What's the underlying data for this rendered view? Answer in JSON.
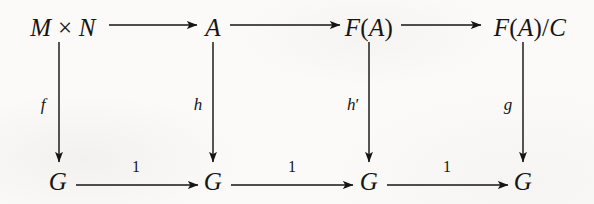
{
  "diagram": {
    "type": "commutative-diagram",
    "title": "",
    "rows": 2,
    "columns": 4,
    "nodes": [
      {
        "id": "n00",
        "label": "M × N",
        "row": 0,
        "col": 0,
        "x": 63,
        "y": 27
      },
      {
        "id": "n01",
        "label": "A",
        "row": 0,
        "col": 1,
        "x": 213,
        "y": 27
      },
      {
        "id": "n02",
        "label": "F(A)",
        "row": 0,
        "col": 2,
        "x": 369,
        "y": 27
      },
      {
        "id": "n03",
        "label": "F(A)/C",
        "row": 0,
        "col": 3,
        "x": 530,
        "y": 27
      },
      {
        "id": "n10",
        "label": "G",
        "row": 1,
        "col": 0,
        "x": 58,
        "y": 181
      },
      {
        "id": "n11",
        "label": "G",
        "row": 1,
        "col": 1,
        "x": 213,
        "y": 181
      },
      {
        "id": "n12",
        "label": "G",
        "row": 1,
        "col": 2,
        "x": 369,
        "y": 181
      },
      {
        "id": "n13",
        "label": "G",
        "row": 1,
        "col": 3,
        "x": 523,
        "y": 181
      }
    ],
    "arrows": [
      {
        "id": "a-top-1",
        "from": "n00",
        "to": "n01",
        "label": "",
        "orientation": "horizontal",
        "x1": 109,
        "y1": 25,
        "x2": 197,
        "y2": 25,
        "lx": 153,
        "ly": 11
      },
      {
        "id": "a-top-2",
        "from": "n01",
        "to": "n02",
        "label": "",
        "orientation": "horizontal",
        "x1": 230,
        "y1": 25,
        "x2": 340,
        "y2": 25,
        "lx": 285,
        "ly": 11
      },
      {
        "id": "a-top-3",
        "from": "n02",
        "to": "n03",
        "label": "",
        "orientation": "horizontal",
        "x1": 401,
        "y1": 25,
        "x2": 481,
        "y2": 25,
        "lx": 441,
        "ly": 11
      },
      {
        "id": "a-left-f",
        "from": "n00",
        "to": "n10",
        "label": "f",
        "orientation": "vertical",
        "x1": 59,
        "y1": 42,
        "x2": 59,
        "y2": 162,
        "lx": 43,
        "ly": 104
      },
      {
        "id": "a-mid-h",
        "from": "n01",
        "to": "n11",
        "label": "h",
        "orientation": "vertical",
        "x1": 213,
        "y1": 42,
        "x2": 213,
        "y2": 162,
        "lx": 198,
        "ly": 104
      },
      {
        "id": "a-mid-hp",
        "from": "n02",
        "to": "n12",
        "label": "h′",
        "orientation": "vertical",
        "x1": 369,
        "y1": 42,
        "x2": 369,
        "y2": 162,
        "lx": 353,
        "ly": 104
      },
      {
        "id": "a-right-g",
        "from": "n03",
        "to": "n13",
        "label": "g",
        "orientation": "vertical",
        "x1": 523,
        "y1": 42,
        "x2": 523,
        "y2": 162,
        "lx": 508,
        "ly": 104
      },
      {
        "id": "a-bot-1",
        "from": "n10",
        "to": "n11",
        "label": "1",
        "orientation": "horizontal",
        "x1": 76,
        "y1": 185,
        "x2": 198,
        "y2": 185,
        "lx": 136,
        "ly": 167
      },
      {
        "id": "a-bot-2",
        "from": "n11",
        "to": "n12",
        "label": "1",
        "orientation": "horizontal",
        "x1": 231,
        "y1": 185,
        "x2": 353,
        "y2": 185,
        "lx": 292,
        "ly": 167
      },
      {
        "id": "a-bot-3",
        "from": "n12",
        "to": "n13",
        "label": "1",
        "orientation": "horizontal",
        "x1": 387,
        "y1": 185,
        "x2": 508,
        "y2": 185,
        "lx": 447,
        "ly": 167
      }
    ],
    "colors": {
      "ink": "#171514",
      "paper": "#fbfaf8"
    }
  }
}
